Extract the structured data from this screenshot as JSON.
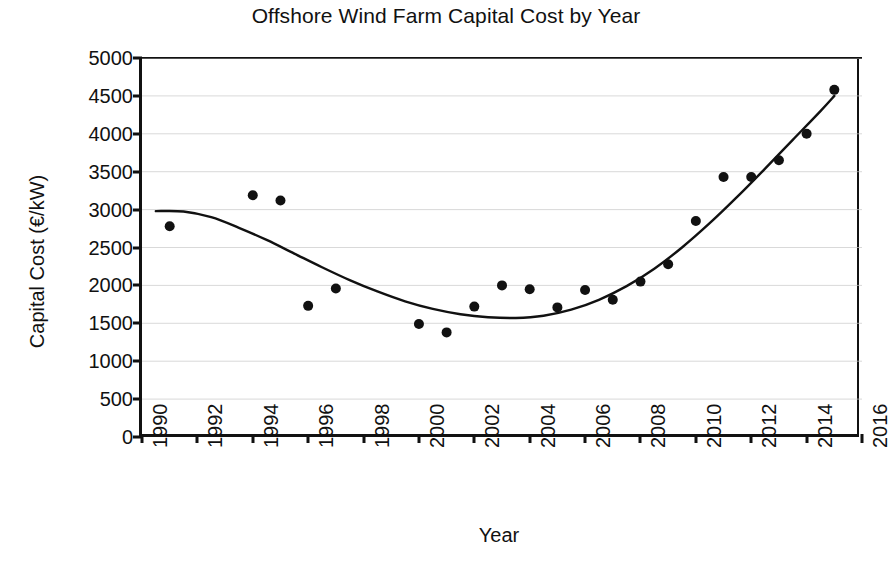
{
  "chart_data": {
    "type": "scatter",
    "title": "Offshore Wind Farm Capital Cost by Year",
    "xlabel": "Year",
    "ylabel": "Capital Cost (€/kW)",
    "xlim": [
      1990,
      2016
    ],
    "ylim": [
      0,
      5000
    ],
    "xticks": [
      1990,
      1992,
      1994,
      1996,
      1998,
      2000,
      2002,
      2004,
      2006,
      2008,
      2010,
      2012,
      2014,
      2016
    ],
    "yticks": [
      0,
      500,
      1000,
      1500,
      2000,
      2500,
      3000,
      3500,
      4000,
      4500,
      5000
    ],
    "xtick_labels": [
      "1990",
      "1992",
      "1994",
      "1996",
      "1998",
      "2000",
      "2002",
      "2004",
      "2006",
      "2008",
      "2010",
      "2012",
      "2014",
      "2016"
    ],
    "ytick_labels": [
      "0",
      "500",
      "1000",
      "1500",
      "2000",
      "2500",
      "3000",
      "3500",
      "4000",
      "4500",
      "5000"
    ],
    "grid": "horizontal",
    "legend": "none",
    "marker_color": "#111111",
    "line_color": "#111111",
    "x": [
      1991,
      1994,
      1995,
      1996,
      1997,
      2000,
      2001,
      2002,
      2003,
      2004,
      2005,
      2006,
      2007,
      2008,
      2009,
      2010,
      2011,
      2012,
      2013,
      2014,
      2015
    ],
    "values": [
      2780,
      3190,
      3120,
      1730,
      1960,
      1490,
      1380,
      1720,
      2000,
      1950,
      1710,
      1940,
      1810,
      2050,
      2280,
      2850,
      3430,
      3430,
      3650,
      4000,
      4580
    ],
    "series": [
      {
        "name": "Capital cost observations",
        "type": "scatter",
        "points": [
          {
            "x": 1991,
            "y": 2780
          },
          {
            "x": 1994,
            "y": 3190
          },
          {
            "x": 1995,
            "y": 3120
          },
          {
            "x": 1996,
            "y": 1730
          },
          {
            "x": 1997,
            "y": 1960
          },
          {
            "x": 2000,
            "y": 1490
          },
          {
            "x": 2001,
            "y": 1380
          },
          {
            "x": 2002,
            "y": 1720
          },
          {
            "x": 2003,
            "y": 2000
          },
          {
            "x": 2004,
            "y": 1950
          },
          {
            "x": 2005,
            "y": 1710
          },
          {
            "x": 2006,
            "y": 1940
          },
          {
            "x": 2007,
            "y": 1810
          },
          {
            "x": 2008,
            "y": 2050
          },
          {
            "x": 2009,
            "y": 2280
          },
          {
            "x": 2010,
            "y": 2850
          },
          {
            "x": 2011,
            "y": 3430
          },
          {
            "x": 2012,
            "y": 3430
          },
          {
            "x": 2013,
            "y": 3650
          },
          {
            "x": 2014,
            "y": 4000
          },
          {
            "x": 2015,
            "y": 4580
          }
        ]
      },
      {
        "name": "Trend curve",
        "type": "line",
        "points": [
          {
            "x": 1990.5,
            "y": 2980
          },
          {
            "x": 1991.5,
            "y": 2975
          },
          {
            "x": 1992.5,
            "y": 2900
          },
          {
            "x": 1993.5,
            "y": 2760
          },
          {
            "x": 1994.5,
            "y": 2600
          },
          {
            "x": 1995.5,
            "y": 2420
          },
          {
            "x": 1996.5,
            "y": 2240
          },
          {
            "x": 1997.5,
            "y": 2070
          },
          {
            "x": 1998.5,
            "y": 1920
          },
          {
            "x": 1999.5,
            "y": 1790
          },
          {
            "x": 2000.5,
            "y": 1690
          },
          {
            "x": 2001.5,
            "y": 1620
          },
          {
            "x": 2002.5,
            "y": 1580
          },
          {
            "x": 2003.5,
            "y": 1570
          },
          {
            "x": 2004.5,
            "y": 1600
          },
          {
            "x": 2005.5,
            "y": 1680
          },
          {
            "x": 2006.5,
            "y": 1810
          },
          {
            "x": 2007.5,
            "y": 1990
          },
          {
            "x": 2008.5,
            "y": 2220
          },
          {
            "x": 2009.5,
            "y": 2500
          },
          {
            "x": 2010.5,
            "y": 2820
          },
          {
            "x": 2011.5,
            "y": 3170
          },
          {
            "x": 2012.5,
            "y": 3540
          },
          {
            "x": 2013.5,
            "y": 3920
          },
          {
            "x": 2014.5,
            "y": 4300
          },
          {
            "x": 2015.0,
            "y": 4500
          }
        ]
      }
    ]
  }
}
